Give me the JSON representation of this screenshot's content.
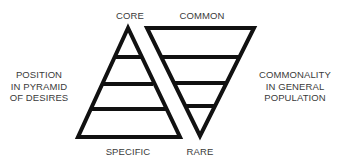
{
  "diagram": {
    "pyramid": {
      "top_label": "CORE",
      "bottom_label": "SPECIFIC",
      "side_label": [
        "POSITION",
        "IN PYRAMID",
        "OF DESIRES"
      ],
      "levels": 4
    },
    "inverted_pyramid": {
      "top_label": "COMMON",
      "bottom_label": "RARE",
      "side_label": [
        "COMMONALITY",
        "IN GENERAL",
        "POPULATION"
      ],
      "levels": 4
    },
    "colors": {
      "stroke": "#111111",
      "text": "#3a3a3a",
      "background": "#ffffff"
    }
  }
}
